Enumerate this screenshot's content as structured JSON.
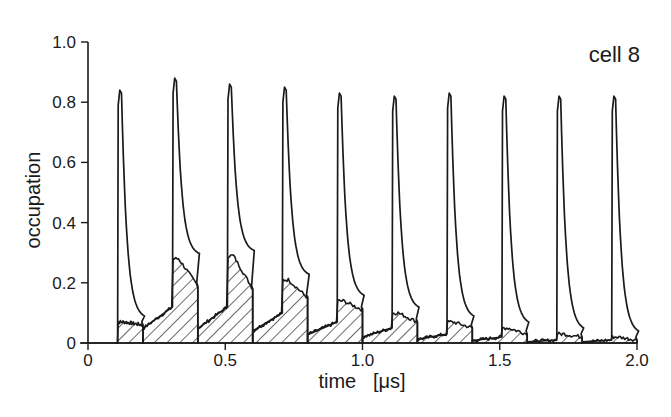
{
  "chart_data": {
    "type": "line",
    "title": "",
    "annotation": "cell 8",
    "xlabel": "time   [μs]",
    "ylabel": "occupation",
    "xlim": [
      0,
      2.0
    ],
    "ylim": [
      0,
      1.0
    ],
    "x_ticks": [
      0,
      0.5,
      1.0,
      1.5,
      2.0
    ],
    "x_tick_labels": [
      "0",
      "0.5",
      "1.0",
      "1.5",
      "2.0"
    ],
    "y_ticks": [
      0,
      0.2,
      0.4,
      0.6,
      0.8,
      1.0
    ],
    "y_tick_labels": [
      "0",
      "0.2",
      "0.4",
      "0.6",
      "0.8",
      "1.0"
    ],
    "grid": false,
    "legend": null,
    "pulse_period_us": 0.2,
    "series": [
      {
        "name": "total occupation (outline)",
        "style": "line",
        "peak_times": [
          0.12,
          0.32,
          0.52,
          0.72,
          0.92,
          1.12,
          1.32,
          1.52,
          1.72,
          1.92
        ],
        "peak_values": [
          0.84,
          0.88,
          0.86,
          0.85,
          0.83,
          0.82,
          0.83,
          0.82,
          0.82,
          0.82
        ]
      },
      {
        "name": "occupation component (hatched)",
        "style": "hatched-area",
        "segment_starts": [
          0.1,
          0.2,
          0.4,
          0.6,
          0.8,
          1.0,
          1.2,
          1.4,
          1.6,
          1.8
        ],
        "segment_ends": [
          0.2,
          0.4,
          0.6,
          0.8,
          1.0,
          1.2,
          1.4,
          1.6,
          1.8,
          2.0
        ],
        "level_before_pulse": [
          0.0,
          0.12,
          0.12,
          0.1,
          0.07,
          0.05,
          0.03,
          0.02,
          0.01,
          0.01
        ],
        "peak_values": [
          0.07,
          0.28,
          0.29,
          0.21,
          0.14,
          0.1,
          0.07,
          0.05,
          0.03,
          0.02
        ],
        "level_at_segment_end": [
          0.06,
          0.19,
          0.18,
          0.15,
          0.11,
          0.07,
          0.05,
          0.03,
          0.02,
          0.01
        ]
      }
    ]
  }
}
